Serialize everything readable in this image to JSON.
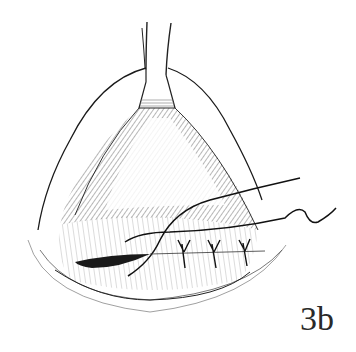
{
  "figure": {
    "label": "3b",
    "colors": {
      "ink": "#1a1a1a",
      "paper": "#ffffff"
    }
  }
}
